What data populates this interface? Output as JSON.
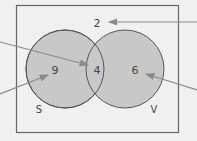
{
  "diagram": {
    "type": "venn",
    "universe_count": "2",
    "sets": [
      {
        "name": "S",
        "only_count": "9"
      },
      {
        "name": "V",
        "only_count": "6"
      }
    ],
    "intersection_count": "4",
    "colors": {
      "background": "#f0f0f0",
      "fill": "#c8c8c8",
      "stroke": "#555555",
      "arrow": "#8a8a8a",
      "text": "#444444"
    }
  }
}
